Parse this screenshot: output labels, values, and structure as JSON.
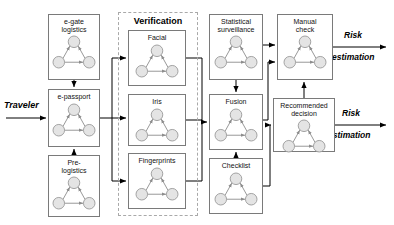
{
  "diagram": {
    "type": "block-flow-diagram",
    "entry_label": "Traveler",
    "panel": {
      "title": "Verification"
    },
    "output_labels": [
      {
        "line1": "Risk",
        "line2": "estimation"
      },
      {
        "line1": "Risk",
        "line2": "estimation"
      }
    ],
    "nodes": [
      {
        "id": "egate",
        "line1": "e-gate",
        "line2": "logistics",
        "x": 48,
        "y": 14,
        "w": 52,
        "h": 66
      },
      {
        "id": "epassport",
        "line1": "e-passport",
        "line2": "",
        "x": 48,
        "y": 89,
        "w": 52,
        "h": 58
      },
      {
        "id": "prelog",
        "line1": "Pre-",
        "line2": "logistics",
        "x": 48,
        "y": 155,
        "w": 52,
        "h": 62
      },
      {
        "id": "facial",
        "line1": "Facial",
        "line2": "",
        "x": 128,
        "y": 30,
        "w": 58,
        "h": 56
      },
      {
        "id": "iris",
        "line1": "Iris",
        "line2": "",
        "x": 128,
        "y": 94,
        "w": 58,
        "h": 52
      },
      {
        "id": "fingerprints",
        "line1": "Fingerprints",
        "line2": "",
        "x": 128,
        "y": 153,
        "w": 58,
        "h": 56
      },
      {
        "id": "statistical",
        "line1": "Statistical",
        "line2": "surveillance",
        "x": 209,
        "y": 14,
        "w": 54,
        "h": 66
      },
      {
        "id": "fusion",
        "line1": "Fusion",
        "line2": "",
        "x": 209,
        "y": 94,
        "w": 54,
        "h": 56
      },
      {
        "id": "checklist",
        "line1": "Checklist",
        "line2": "",
        "x": 209,
        "y": 158,
        "w": 54,
        "h": 56
      },
      {
        "id": "manual",
        "line1": "Manual",
        "line2": "check",
        "x": 277,
        "y": 14,
        "w": 56,
        "h": 66
      },
      {
        "id": "recommended",
        "line1": "Recommended",
        "line2": "decision",
        "x": 273,
        "y": 98,
        "w": 62,
        "h": 54
      }
    ],
    "panel_box": {
      "x": 118,
      "y": 12,
      "w": 80,
      "h": 204
    },
    "motif": {
      "description": "three-node graph: one top node, two bottom nodes, arrows bottom-left to top, bottom-right to top, bottom-left to bottom-right",
      "node_fill": "#e4e4e4",
      "node_stroke": "#9a9a9a"
    },
    "colors": {
      "box_stroke": "#7a7a7a",
      "panel_stroke": "#a9a9a9",
      "wire": "#000000",
      "background": "#ffffff"
    }
  }
}
